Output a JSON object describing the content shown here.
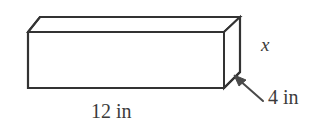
{
  "figure": {
    "name": "rectangular-prism-dimension-diagram",
    "shape": "rectangular prism",
    "projection": "oblique",
    "background_color": "#ffffff",
    "stroke_color": "#333333",
    "text_color": "#3b3b3b"
  },
  "labels": {
    "length": "12 in",
    "depth": "4 in",
    "height": "x"
  },
  "annotations": {
    "depth_arrow": {
      "icon": "arrow-up-left-icon",
      "points_to": "right-face-of-prism"
    }
  },
  "geometry": {
    "front_face": {
      "top_left_x": 28,
      "top_y": 32,
      "bottom_y": 88,
      "right_x": 224
    },
    "back_offset_x": 16,
    "back_offset_y": -15
  }
}
